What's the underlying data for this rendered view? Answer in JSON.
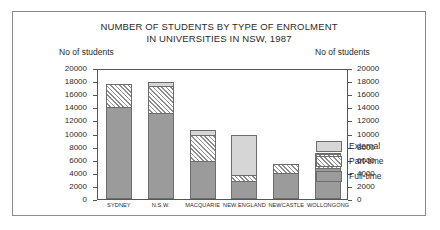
{
  "chart_data": {
    "type": "bar",
    "title": "NUMBER OF STUDENTS BY TYPE OF ENROLMENT IN UNIVERSITIES IN NSW, 1987",
    "title_lines": [
      "NUMBER OF STUDENTS BY TYPE OF ENROLMENT",
      "IN UNIVERSITIES IN NSW, 1987"
    ],
    "xlabel": "",
    "ylabel": "No of students",
    "ylabel_right": "No of students",
    "ylim": [
      0,
      20000
    ],
    "ytick_step": 2000,
    "yticks": [
      "0",
      "2000",
      "4000",
      "6000",
      "8000",
      "10000",
      "12000",
      "14000",
      "16000",
      "18000",
      "20000"
    ],
    "grid": false,
    "stacked": true,
    "legend_position": "inside-top-right",
    "categories": [
      "SYDNEY",
      "N.S.W.",
      "MACQUARIE",
      "NEW ENGLAND",
      "NEWCASTLE",
      "WOLLONGONG"
    ],
    "series": [
      {
        "name": "Full-time",
        "color": "#9b9b9b",
        "values": [
          14000,
          13200,
          5800,
          2800,
          4000,
          4700
        ]
      },
      {
        "name": "Part-time",
        "color": "#ffffff",
        "values": [
          3600,
          4000,
          4000,
          800,
          1400,
          2100
        ]
      },
      {
        "name": "External",
        "color": "#d6d6d6",
        "values": [
          0,
          600,
          700,
          6100,
          0,
          300
        ]
      }
    ],
    "totals": [
      17600,
      17800,
      10500,
      9700,
      5400,
      7100
    ]
  },
  "legend": {
    "items": [
      {
        "label": "External",
        "swatch": "external-swatch"
      },
      {
        "label": "Part-time",
        "swatch": "part-time-swatch"
      },
      {
        "label": "Full-time",
        "swatch": "full-time-swatch"
      }
    ]
  },
  "colors": {
    "full_time": "#9b9b9b",
    "part_time": "#ffffff",
    "external": "#d6d6d6",
    "outline": "#6d6d6d",
    "axis": "#555555",
    "text": "#2b2b2b",
    "frame": "#8a8a8a"
  }
}
